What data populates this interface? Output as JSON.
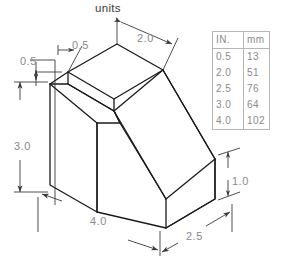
{
  "drawing": {
    "title": "units",
    "type": "isometric-pictorial",
    "object": "stepped-block-with-inclined-face",
    "line_color": "#1a1a1a",
    "dimension_color": "#8a8a8a",
    "background": "#ffffff",
    "dimensions": [
      {
        "id": "top-left-width",
        "label": "0.5",
        "x": 72,
        "y": 40
      },
      {
        "id": "top-right-width",
        "label": "2.0",
        "x": 137,
        "y": 33
      },
      {
        "id": "upper-left-depth",
        "label": "0.5",
        "x": 20,
        "y": 56
      },
      {
        "id": "left-height",
        "label": "3.0",
        "x": 14,
        "y": 141
      },
      {
        "id": "bottom-width",
        "label": "4.0",
        "x": 90,
        "y": 216
      },
      {
        "id": "bottom-depth",
        "label": "2.5",
        "x": 186,
        "y": 231
      },
      {
        "id": "right-height",
        "label": "1.0",
        "x": 232,
        "y": 176
      }
    ]
  },
  "conversion_table": {
    "headers": [
      "IN.",
      "mm"
    ],
    "rows": [
      {
        "inches": "0.5",
        "mm": "13"
      },
      {
        "inches": "2.0",
        "mm": "51"
      },
      {
        "inches": "2.5",
        "mm": "76"
      },
      {
        "inches": "3.0",
        "mm": "64"
      },
      {
        "inches": "4.0",
        "mm": "102"
      }
    ]
  }
}
